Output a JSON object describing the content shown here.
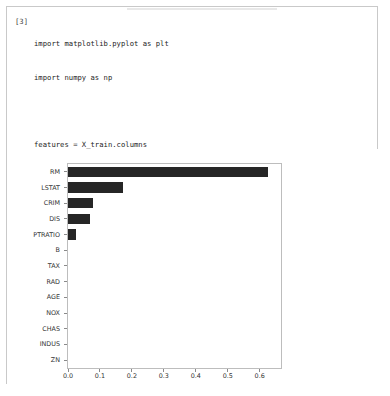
{
  "notebook": {
    "prompt": "[3]",
    "code_lines": [
      "import matplotlib.pyplot as plt",
      "import numpy as np",
      "",
      "features = X_train.columns",
      "importances = tree_reg.feature_importances_",
      "indices = np.argsort(importances)",
      "",
      "plt.figure(figsize=(6,6))",
      "plt.barh(range(len(indices)), importances[indices], color=\"b\", align=\"center\")",
      "plt.yticks(range(len(indices)), features[indices])",
      "plt.show()"
    ]
  },
  "chart_data": {
    "type": "bar",
    "orientation": "horizontal",
    "title": "",
    "xlabel": "",
    "ylabel": "",
    "categories": [
      "ZN",
      "INDUS",
      "CHAS",
      "NOX",
      "AGE",
      "RAD",
      "TAX",
      "B",
      "PTRATIO",
      "DIS",
      "CRIM",
      "LSTAT",
      "RM"
    ],
    "values": [
      0.0,
      0.0,
      0.0,
      0.0,
      0.0,
      0.0,
      0.0,
      0.0,
      0.025,
      0.068,
      0.077,
      0.173,
      0.625
    ],
    "categories_top_to_bottom": [
      "RM",
      "LSTAT",
      "CRIM",
      "DIS",
      "PTRATIO",
      "B",
      "TAX",
      "RAD",
      "AGE",
      "NOX",
      "CHAS",
      "INDUS",
      "ZN"
    ],
    "values_top_to_bottom": [
      0.625,
      0.173,
      0.077,
      0.068,
      0.025,
      0.0,
      0.0,
      0.0,
      0.0,
      0.0,
      0.0,
      0.0,
      0.0
    ],
    "xticks": [
      "0.0",
      "0.1",
      "0.2",
      "0.3",
      "0.4",
      "0.5",
      "0.6"
    ],
    "xtick_values": [
      0.0,
      0.1,
      0.2,
      0.3,
      0.4,
      0.5,
      0.6
    ],
    "xlim": [
      0.0,
      0.6667
    ],
    "grid": false,
    "legend": false,
    "bar_color": "#262626",
    "frame_color": "#bdbdbd"
  }
}
